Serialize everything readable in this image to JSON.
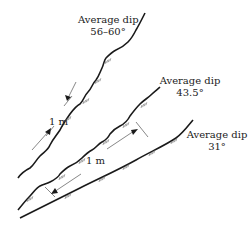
{
  "diagram": {
    "joints": [
      {
        "id": "steep",
        "label_line1": "Average dip",
        "label_line2": "56–60°"
      },
      {
        "id": "medium",
        "label_line1": "Average dip",
        "label_line2": "43.5°"
      },
      {
        "id": "shallow",
        "label_line1": "Average dip",
        "label_line2": "31°"
      }
    ],
    "spacings": [
      {
        "between": [
          "steep",
          "medium"
        ],
        "label": "1 m"
      },
      {
        "between": [
          "medium",
          "shallow"
        ],
        "label": "1 m"
      }
    ],
    "colors": {
      "line": "#1a1a1a",
      "hatch": "#777777",
      "arrow": "#555555",
      "text": "#222222"
    }
  }
}
